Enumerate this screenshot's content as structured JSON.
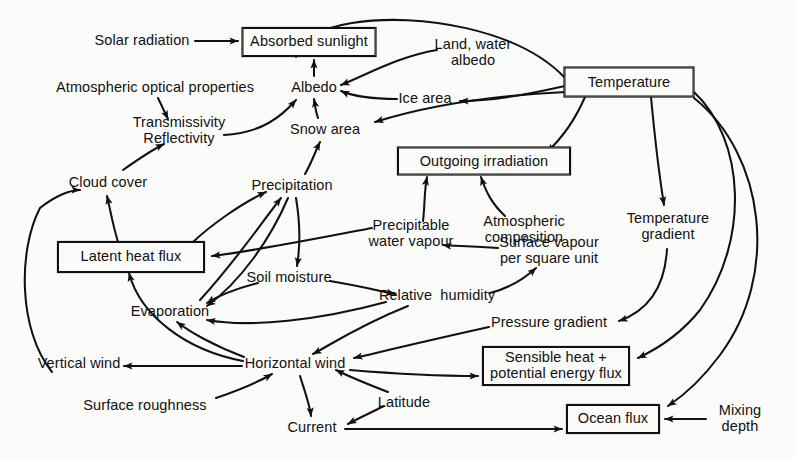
{
  "diagram": {
    "kind": "influence-diagram",
    "stroke_color": "#111111",
    "background_color": "#fbfbf9",
    "width": 795,
    "height": 460
  },
  "nodes": [
    {
      "id": "solar-radiation",
      "label": "Solar radiation",
      "shape": "plain",
      "x": 142,
      "y": 41,
      "w": 0,
      "h": 0
    },
    {
      "id": "absorbed-sunlight",
      "label": "Absorbed sunlight",
      "shape": "boxed",
      "x": 309,
      "y": 42,
      "w": 133,
      "h": 28
    },
    {
      "id": "atmospheric-optical",
      "label": "Atmospheric optical properties",
      "shape": "plain",
      "x": 155,
      "y": 88,
      "w": 0,
      "h": 0
    },
    {
      "id": "albedo",
      "label": "Albedo",
      "shape": "plain",
      "x": 314,
      "y": 88,
      "w": 0,
      "h": 0
    },
    {
      "id": "land-water-albedo",
      "label": "Land, water\nalbedo",
      "shape": "plain",
      "x": 473,
      "y": 53,
      "w": 0,
      "h": 0
    },
    {
      "id": "temperature",
      "label": "Temperature",
      "shape": "boxed",
      "x": 629,
      "y": 82,
      "w": 129,
      "h": 29
    },
    {
      "id": "ice-area",
      "label": "Ice area",
      "shape": "plain",
      "x": 425,
      "y": 99,
      "w": 0,
      "h": 0
    },
    {
      "id": "transmissivity",
      "label": "Transmissivity\nReflectivity",
      "shape": "plain",
      "x": 179,
      "y": 131,
      "w": 0,
      "h": 0
    },
    {
      "id": "snow-area",
      "label": "Snow area",
      "shape": "plain",
      "x": 325,
      "y": 130,
      "w": 0,
      "h": 0
    },
    {
      "id": "outgoing-irradiation",
      "label": "Outgoing irradiation",
      "shape": "boxed",
      "x": 484,
      "y": 161,
      "w": 172,
      "h": 27
    },
    {
      "id": "cloud-cover",
      "label": "Cloud cover",
      "shape": "plain",
      "x": 108,
      "y": 183,
      "w": 0,
      "h": 0
    },
    {
      "id": "precipitation",
      "label": "Precipitation",
      "shape": "plain",
      "x": 292,
      "y": 186,
      "w": 0,
      "h": 0
    },
    {
      "id": "atmospheric-composition",
      "label": "Atmospheric\ncomposition",
      "shape": "plain",
      "x": 524,
      "y": 230,
      "w": 0,
      "h": 0
    },
    {
      "id": "temperature-gradient",
      "label": "Temperature\ngradient",
      "shape": "plain",
      "x": 668,
      "y": 227,
      "w": 0,
      "h": 0
    },
    {
      "id": "precipitable-water",
      "label": "Precipitable\nwater vapour",
      "shape": "plain",
      "x": 411,
      "y": 234,
      "w": 0,
      "h": 0
    },
    {
      "id": "latent-heat-flux",
      "label": "Latent heat flux",
      "shape": "boxed",
      "x": 131,
      "y": 257,
      "w": 146,
      "h": 30
    },
    {
      "id": "surface-vapour",
      "label": "Surface vapour\nper square unit",
      "shape": "plain",
      "x": 549,
      "y": 251,
      "w": 0,
      "h": 0
    },
    {
      "id": "soil-moisture",
      "label": "Soil moisture",
      "shape": "plain",
      "x": 289,
      "y": 278,
      "w": 0,
      "h": 0
    },
    {
      "id": "evaporation",
      "label": "Evaporation",
      "shape": "plain",
      "x": 170,
      "y": 312,
      "w": 0,
      "h": 0
    },
    {
      "id": "relative-humidity",
      "label": "Relative  humidity",
      "shape": "plain",
      "x": 437,
      "y": 296,
      "w": 0,
      "h": 0
    },
    {
      "id": "pressure-gradient",
      "label": "Pressure gradient",
      "shape": "plain",
      "x": 549,
      "y": 323,
      "w": 0,
      "h": 0
    },
    {
      "id": "vertical-wind",
      "label": "Vertical wind",
      "shape": "plain",
      "x": 79,
      "y": 364,
      "w": 0,
      "h": 0
    },
    {
      "id": "horizontal-wind",
      "label": "Horizontal wind",
      "shape": "plain",
      "x": 295,
      "y": 364,
      "w": 0,
      "h": 0
    },
    {
      "id": "sensible-heat-flux",
      "label": "Sensible heat +\npotential energy flux",
      "shape": "boxed",
      "x": 556,
      "y": 366,
      "w": 146,
      "h": 38
    },
    {
      "id": "surface-roughness",
      "label": "Surface roughness",
      "shape": "plain",
      "x": 145,
      "y": 406,
      "w": 0,
      "h": 0
    },
    {
      "id": "latitude",
      "label": "Latitude",
      "shape": "plain",
      "x": 404,
      "y": 403,
      "w": 0,
      "h": 0
    },
    {
      "id": "ocean-flux",
      "label": "Ocean flux",
      "shape": "boxed",
      "x": 613,
      "y": 419,
      "w": 92,
      "h": 28
    },
    {
      "id": "mixing-depth",
      "label": "Mixing\ndepth",
      "shape": "plain",
      "x": 740,
      "y": 419,
      "w": 0,
      "h": 0
    },
    {
      "id": "current",
      "label": "Current",
      "shape": "plain",
      "x": 312,
      "y": 428,
      "w": 0,
      "h": 0
    }
  ],
  "edges": [
    {
      "from": "solar-radiation",
      "to": "absorbed-sunlight",
      "path": "M195,41 L238,41"
    },
    {
      "from": "albedo",
      "to": "absorbed-sunlight",
      "path": "M314,76 L314,60"
    },
    {
      "from": "atmospheric-optical",
      "to": "transmissivity",
      "path": "M158,98 L168,119"
    },
    {
      "from": "transmissivity",
      "to": "albedo",
      "path": "M224,135 C262,133 282,116 296,100"
    },
    {
      "from": "cloud-cover",
      "to": "transmissivity",
      "path": "M123,170 C140,158 150,151 164,144"
    },
    {
      "from": "land-water-albedo",
      "to": "albedo",
      "path": "M437,50 C400,56 368,74 341,85"
    },
    {
      "from": "temperature",
      "to": "land-water-albedo",
      "path": "M565,78 C520,30 420,12 352,23 C320,28 300,40 296,57"
    },
    {
      "from": "ice-area",
      "to": "albedo",
      "path": "M397,99 C370,99 350,95 341,91"
    },
    {
      "from": "temperature",
      "to": "ice-area",
      "path": "M565,86 C520,96 490,101 460,101"
    },
    {
      "from": "temperature",
      "to": "snow-area",
      "path": "M566,92 C480,96 420,108 375,122"
    },
    {
      "from": "snow-area",
      "to": "albedo",
      "path": "M318,118 C315,110 315,104 314,99"
    },
    {
      "from": "precipitation",
      "to": "snow-area",
      "path": "M305,174 C312,162 315,152 320,142"
    },
    {
      "from": "temperature",
      "to": "outgoing-irradiation",
      "path": "M585,97 C575,120 560,140 547,152"
    },
    {
      "from": "precipitable-water",
      "to": "outgoing-irradiation",
      "path": "M423,221 C425,205 424,192 427,177"
    },
    {
      "from": "atmospheric-composition",
      "to": "outgoing-irradiation",
      "path": "M505,216 C492,204 486,192 481,177"
    },
    {
      "from": "temperature",
      "to": "temperature-gradient",
      "path": "M651,97 C655,140 660,180 664,205"
    },
    {
      "from": "temperature-gradient",
      "to": "pressure-gradient",
      "path": "M667,249 C665,285 650,310 619,321"
    },
    {
      "from": "latent-heat-flux",
      "to": "cloud-cover",
      "path": "M118,242 C112,222 110,208 107,196"
    },
    {
      "from": "latent-heat-flux",
      "to": "precipitation",
      "path": "M193,242 C210,226 240,204 266,192"
    },
    {
      "from": "precipitable-water",
      "to": "latent-heat-flux",
      "path": "M372,228 C320,238 260,250 212,256"
    },
    {
      "from": "precipitation",
      "to": "soil-moisture",
      "path": "M296,198 C300,222 300,248 297,266"
    },
    {
      "from": "precipitation",
      "to": "evaporation",
      "path": "M288,198 C270,240 240,282 207,306"
    },
    {
      "from": "evaporation",
      "to": "precipitation",
      "path": "M200,300 C235,262 262,222 281,198"
    },
    {
      "from": "soil-moisture",
      "to": "evaporation",
      "path": "M258,283 C235,289 218,296 207,303"
    },
    {
      "from": "soil-moisture",
      "to": "relative-humidity",
      "path": "M330,281 C360,286 380,291 395,294"
    },
    {
      "from": "relative-humidity",
      "to": "surface-vapour",
      "path": "M490,293 C510,288 525,278 536,268"
    },
    {
      "from": "surface-vapour",
      "to": "precipitable-water",
      "path": "M498,248 C470,246 450,246 443,245"
    },
    {
      "from": "relative-humidity",
      "to": "evaporation",
      "path": "M386,302 C320,320 250,328 207,320"
    },
    {
      "from": "relative-humidity",
      "to": "horizontal-wind",
      "path": "M408,306 C360,325 330,345 313,354"
    },
    {
      "from": "horizontal-wind",
      "to": "evaporation",
      "path": "M244,357 C215,346 190,332 177,322"
    },
    {
      "from": "horizontal-wind",
      "to": "latent-heat-flux",
      "path": "M243,361 C185,350 140,315 129,273"
    },
    {
      "from": "horizontal-wind",
      "to": "vertical-wind",
      "path": "M242,366 L124,366"
    },
    {
      "from": "vertical-wind",
      "to": "cloud-cover",
      "path": "M52,372 C18,330 18,250 40,208 C55,196 70,190 80,190"
    },
    {
      "from": "surface-roughness",
      "to": "horizontal-wind",
      "path": "M216,398 C245,388 262,380 272,374"
    },
    {
      "from": "horizontal-wind",
      "to": "current",
      "path": "M300,376 C305,392 310,406 311,416"
    },
    {
      "from": "pressure-gradient",
      "to": "horizontal-wind",
      "path": "M489,327 C430,340 380,352 354,358"
    },
    {
      "from": "horizontal-wind",
      "to": "sensible-heat-flux",
      "path": "M350,370 C410,375 455,376 478,376"
    },
    {
      "from": "latitude",
      "to": "horizontal-wind",
      "path": "M388,392 C362,382 344,374 336,370"
    },
    {
      "from": "latitude",
      "to": "current",
      "path": "M384,406 C368,414 355,420 348,424"
    },
    {
      "from": "current",
      "to": "ocean-flux",
      "path": "M345,429 L562,429"
    },
    {
      "from": "mixing-depth",
      "to": "ocean-flux",
      "path": "M706,419 L665,419"
    },
    {
      "from": "temperature",
      "to": "sensible-heat-flux",
      "path": "M694,92 C745,140 750,240 700,310 C680,335 655,350 638,358"
    },
    {
      "from": "temperature",
      "to": "ocean-flux",
      "path": "M694,98 C765,155 780,275 720,355 C700,382 680,398 668,406"
    }
  ]
}
